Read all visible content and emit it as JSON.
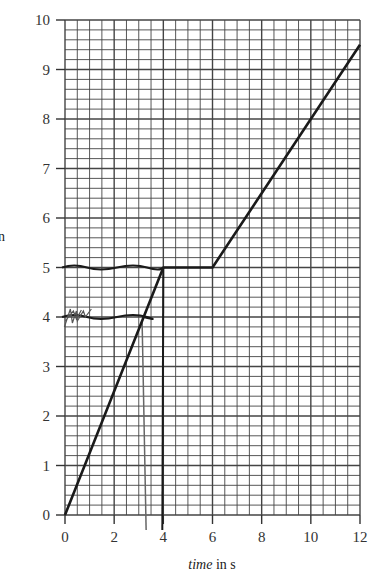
{
  "chart_data": {
    "type": "line",
    "title": "",
    "xlabel_italic": "time",
    "xlabel_unit": " in s",
    "ylabel": "",
    "xlim": [
      0,
      12
    ],
    "ylim": [
      0,
      10
    ],
    "x_ticks": [
      0,
      2,
      4,
      6,
      8,
      10,
      12
    ],
    "y_ticks": [
      0,
      1,
      2,
      3,
      4,
      5,
      6,
      7,
      8,
      9,
      10
    ],
    "x_minor_step": 0.5,
    "y_minor_step": 0.2,
    "grid": true,
    "series": [
      {
        "name": "printed graph",
        "x": [
          0,
          4,
          6,
          12
        ],
        "y": [
          0,
          5,
          5,
          9.5
        ]
      }
    ],
    "annotations": [
      {
        "type": "hand-drawn horizontal line",
        "y": 5,
        "x_from": 0,
        "x_to": 4
      },
      {
        "type": "hand-drawn horizontal line",
        "y": 4,
        "x_from": 0,
        "x_to": 3.2
      },
      {
        "type": "hand-drawn vertical line",
        "x": 4,
        "y_from": 5,
        "y_to": 0
      },
      {
        "type": "hand-drawn faint vertical line",
        "x": 3.3,
        "y_from": 4,
        "y_to": 0
      },
      {
        "type": "scribble",
        "x": 0.3,
        "y": 4
      }
    ]
  },
  "labels": {
    "y_axis_partial": "n"
  }
}
